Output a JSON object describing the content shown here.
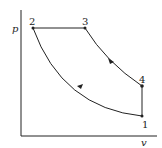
{
  "diagram": {
    "type": "p-v diagram",
    "axes": {
      "y_label": "p",
      "x_label": "v"
    },
    "points": [
      {
        "id": "1",
        "label": "1",
        "x": 142,
        "y": 116
      },
      {
        "id": "2",
        "label": "2",
        "x": 33,
        "y": 28
      },
      {
        "id": "3",
        "label": "3",
        "x": 85,
        "y": 28
      },
      {
        "id": "4",
        "label": "4",
        "x": 142,
        "y": 86
      }
    ],
    "processes": [
      {
        "from": "1",
        "to": "2",
        "shape": "curve",
        "arrow": "toward 2"
      },
      {
        "from": "2",
        "to": "3",
        "shape": "horizontal line"
      },
      {
        "from": "3",
        "to": "4",
        "shape": "curve",
        "arrow": "toward 4"
      },
      {
        "from": "4",
        "to": "1",
        "shape": "vertical line"
      }
    ],
    "colors": {
      "line": "#222222",
      "background": "#ffffff"
    }
  }
}
